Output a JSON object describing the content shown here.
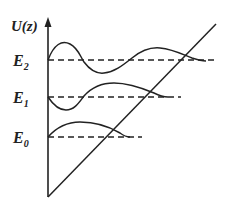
{
  "diagram": {
    "type": "quantum-bouncer-potential",
    "y_axis_label": "U(z)",
    "levels": [
      {
        "name": "E",
        "sub": "2",
        "y": 60,
        "dash_end_x": 217
      },
      {
        "name": "E",
        "sub": "1",
        "y": 97,
        "dash_end_x": 181
      },
      {
        "name": "E",
        "sub": "0",
        "y": 137,
        "dash_end_x": 142
      }
    ],
    "colors": {
      "line": "#222222",
      "background": "#ffffff"
    }
  }
}
